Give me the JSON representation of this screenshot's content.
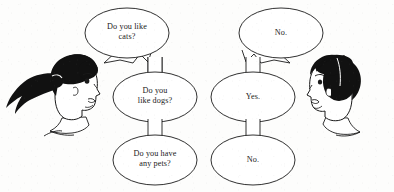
{
  "scene": {
    "title": "Conversation cartoon with speech bubbles",
    "background_color": "#fdfdfc",
    "ink_color": "#1a1a1a",
    "width": 394,
    "height": 192
  },
  "characters": [
    {
      "id": "girl",
      "name": "girl-with-ponytail",
      "side": "left",
      "facing": "right",
      "hair_color": "#111111",
      "skin_color": "#ffffff",
      "role": "asker"
    },
    {
      "id": "boy",
      "name": "boy-short-hair",
      "side": "right",
      "facing": "left",
      "hair_color": "#111111",
      "skin_color": "#ffffff",
      "role": "answerer"
    }
  ],
  "bubbles": {
    "left_column": [
      {
        "id": "q1",
        "text": "Do you like\ncats?",
        "speaker": "girl",
        "tail": "zigzag-left"
      },
      {
        "id": "q2",
        "text": "Do you\nlike dogs?",
        "speaker": "girl",
        "tail": "neck-up"
      },
      {
        "id": "q3",
        "text": "Do you have\nany pets?",
        "speaker": "girl",
        "tail": "neck-up"
      }
    ],
    "right_column": [
      {
        "id": "a1",
        "text": "No.",
        "speaker": "boy",
        "tail": "zigzag-right"
      },
      {
        "id": "a2",
        "text": "Yes.",
        "speaker": "boy",
        "tail": "neck-up"
      },
      {
        "id": "a3",
        "text": "No.",
        "speaker": "boy",
        "tail": "neck-up"
      }
    ]
  }
}
